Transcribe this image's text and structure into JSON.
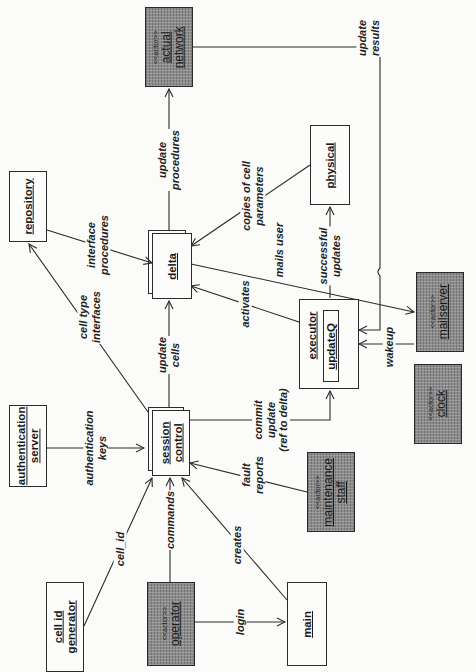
{
  "diagram": {
    "type": "collaboration-diagram",
    "orientation": "rotated-90-ccw",
    "colors": {
      "background": "#fbfbf9",
      "box_fill": "#fcfcfa",
      "actor_fill": "#8c8c8c",
      "line": "#2a2a2a"
    },
    "nodes": {
      "actual_network": {
        "stereotype": "<<actor>>",
        "lines": [
          "actual",
          "network"
        ],
        "kind": "actor"
      },
      "repository": {
        "lines": [
          "repository"
        ],
        "kind": "object"
      },
      "delta": {
        "lines": [
          "delta"
        ],
        "kind": "multi-object"
      },
      "physical": {
        "lines": [
          "physical"
        ],
        "kind": "object"
      },
      "mailserver": {
        "stereotype": "<<actor>>",
        "lines": [
          "mailserver"
        ],
        "kind": "actor"
      },
      "executor": {
        "lines": [
          "executor"
        ],
        "kind": "object",
        "inner": "updateQ"
      },
      "clock": {
        "stereotype": "<<actor>>",
        "lines": [
          "clock"
        ],
        "kind": "actor"
      },
      "authentication_server": {
        "lines": [
          "authentication",
          "server"
        ],
        "kind": "object"
      },
      "session_control": {
        "lines": [
          "session",
          "control"
        ],
        "kind": "multi-object"
      },
      "maintenance_staff": {
        "stereotype": "<<actor>>",
        "lines": [
          "maintenance",
          "staff"
        ],
        "kind": "actor"
      },
      "cell_id_generator": {
        "lines": [
          "cell id",
          "generator"
        ],
        "kind": "object"
      },
      "operator": {
        "stereotype": "<<actor>>",
        "lines": [
          "operator"
        ],
        "kind": "actor"
      },
      "main": {
        "lines": [
          "main"
        ],
        "kind": "object"
      }
    },
    "edges": {
      "update_procedures": {
        "from": "delta",
        "to": "actual_network",
        "lines": [
          "update",
          "procedures"
        ]
      },
      "update_results": {
        "from": "actual_network",
        "to": "executor",
        "lines": [
          "update",
          "results"
        ]
      },
      "interface_procedures": {
        "from": "repository",
        "to": "delta",
        "lines": [
          "interface",
          "procedures"
        ]
      },
      "copies_of_cell_parameters": {
        "from": "physical",
        "to": "delta",
        "lines": [
          "copies of cell",
          "parameters"
        ]
      },
      "mails_user": {
        "from": "delta",
        "to": "mailserver",
        "lines": [
          "mails user"
        ]
      },
      "successful_updates": {
        "from": "executor",
        "to": "physical",
        "lines": [
          "successful",
          "updates"
        ]
      },
      "activates": {
        "from": "executor",
        "to": "delta",
        "lines": [
          "activates"
        ]
      },
      "wakeup": {
        "from": "clock",
        "to": "executor",
        "lines": [
          "wakeup"
        ]
      },
      "cell_type_interfaces": {
        "from": "session_control",
        "to": "repository",
        "lines": [
          "cell type",
          "interfaces"
        ]
      },
      "update_cells": {
        "from": "session_control",
        "to": "delta",
        "lines": [
          "update",
          "cells"
        ]
      },
      "authentication_keys": {
        "from": "authentication_server",
        "to": "session_control",
        "lines": [
          "authentication",
          "keys"
        ]
      },
      "commit_update": {
        "from": "session_control",
        "to": "executor",
        "lines": [
          "commit",
          "update",
          "(ref to delta)"
        ]
      },
      "fault_reports": {
        "from": "maintenance_staff",
        "to": "session_control",
        "lines": [
          "fault",
          "reports"
        ]
      },
      "cell_id": {
        "from": "cell_id_generator",
        "to": "session_control",
        "lines": [
          "cell_id"
        ]
      },
      "commands": {
        "from": "operator",
        "to": "session_control",
        "lines": [
          "commands"
        ]
      },
      "creates": {
        "from": "main",
        "to": "session_control",
        "lines": [
          "creates"
        ]
      },
      "login": {
        "from": "operator",
        "to": "main",
        "lines": [
          "login"
        ]
      }
    }
  }
}
